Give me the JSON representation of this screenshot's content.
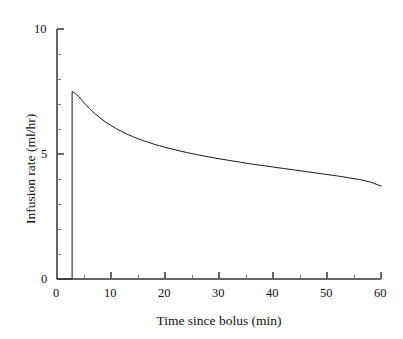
{
  "chart_data": {
    "type": "line",
    "title": "",
    "subtitle": "",
    "xlabel": "Time since bolus (min)",
    "ylabel": "Infusion rate (ml/hr)",
    "xlim": [
      0,
      60
    ],
    "ylim": [
      0,
      10
    ],
    "xticks": [
      0,
      10,
      20,
      30,
      40,
      50,
      60
    ],
    "xtick_labels": [
      "0",
      "10",
      "20",
      "30",
      "40",
      "50",
      "60"
    ],
    "xminor_ticks": [
      5,
      15,
      25,
      35,
      45,
      55
    ],
    "yticks": [
      0,
      5,
      10
    ],
    "ytick_labels": [
      "0",
      "5",
      "10"
    ],
    "yminor_ticks": [
      1,
      2,
      3,
      4,
      6,
      7,
      8,
      9
    ],
    "grid": false,
    "legend": null,
    "annotations": [],
    "line_color": "#1a1a1a",
    "line_width": 1,
    "axis_color": "#555555",
    "background_color": "#ffffff",
    "series": [
      {
        "name": "Infusion rate",
        "x": [
          0,
          1,
          2,
          2.8,
          2.8,
          3.2,
          3.6,
          4,
          4.5,
          5,
          5.5,
          6,
          7,
          8,
          9,
          10,
          11,
          12,
          13,
          14,
          15,
          16,
          17,
          18,
          19,
          20,
          22,
          24,
          26,
          28,
          30,
          32,
          34,
          36,
          38,
          40,
          42,
          44,
          46,
          48,
          50,
          52,
          54,
          56,
          58,
          60
        ],
        "values": [
          0,
          0,
          0,
          0,
          7.5,
          7.45,
          7.38,
          7.3,
          7.18,
          7.05,
          6.93,
          6.82,
          6.62,
          6.44,
          6.28,
          6.14,
          6.01,
          5.9,
          5.79,
          5.7,
          5.61,
          5.53,
          5.46,
          5.39,
          5.33,
          5.27,
          5.16,
          5.06,
          4.97,
          4.89,
          4.81,
          4.74,
          4.67,
          4.6,
          4.54,
          4.48,
          4.42,
          4.36,
          4.3,
          4.24,
          4.18,
          4.12,
          4.05,
          3.98,
          3.88,
          3.72
        ]
      }
    ]
  }
}
